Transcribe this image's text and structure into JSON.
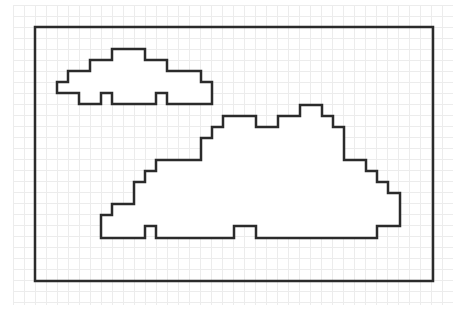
{
  "diagram": {
    "type": "pixel-art outline",
    "grid": {
      "cell_px": 11,
      "color": "#ececec"
    },
    "stroke_color": "#2b2b2b",
    "background": "#ffffff",
    "frame": {
      "x": 35,
      "y": 27,
      "width": 398,
      "height": 254
    },
    "shapes": [
      {
        "name": "small-cloud",
        "points": "57,82 68,82 68,71 90,71 90,60 112,60 112,49 145,49 145,60 167,60 167,71 201,71 201,82 212,82 212,104 167,104 167,93 156,93 156,104 112,104 112,93 101,93 101,104 79,104 79,93 57,93"
      },
      {
        "name": "large-cloud",
        "points": "101,215 112,215 112,204 134,204 134,182 145,182 145,171 156,171 156,160 201,160 201,138 212,138 212,127 223,127 223,116 256,116 256,127 278,127 278,116 300,116 300,105 322,105 322,116 333,116 333,127 344,127 344,160 366,160 366,171 377,171 377,182 388,182 388,193 400,193 400,226 377,226 377,238 256,238 256,226 234,226 234,238 156,238 156,226 145,226 145,238 101,238"
      }
    ]
  }
}
